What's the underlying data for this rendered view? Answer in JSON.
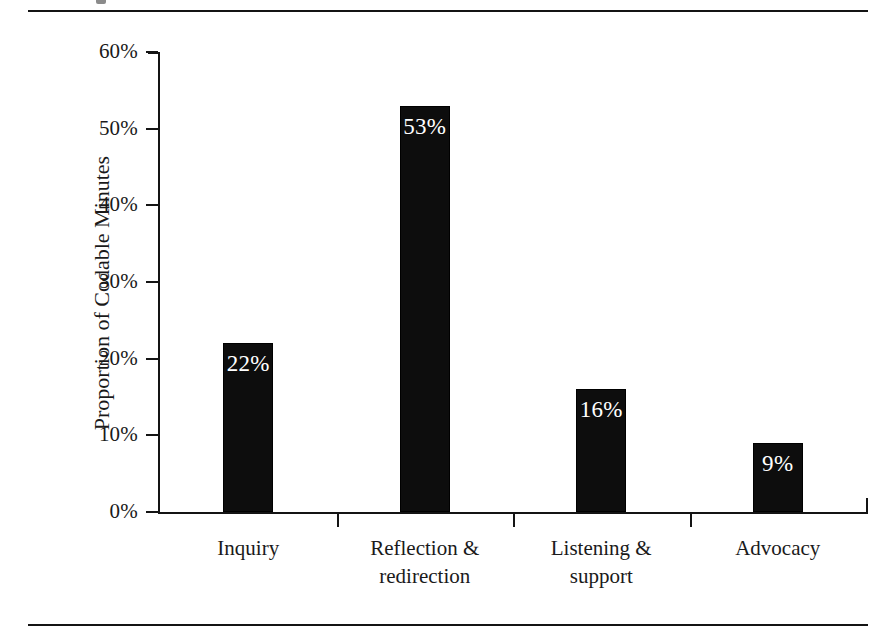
{
  "figure": {
    "rules": {
      "top_label": "top-rule",
      "bottom_label": "bottom-rule"
    }
  },
  "chart_data": {
    "type": "bar",
    "title": "",
    "xlabel": "",
    "ylabel": "Proportion of Codable Minutes",
    "categories": [
      "Inquiry",
      "Reflection &\nredirection",
      "Listening &\nsupport",
      "Advocacy"
    ],
    "values": [
      22,
      53,
      16,
      9
    ],
    "data_labels": [
      "22%",
      "53%",
      "16%",
      "9%"
    ],
    "ylim": [
      0,
      60
    ],
    "yticks": [
      0,
      10,
      20,
      30,
      40,
      50,
      60
    ],
    "ytick_labels": [
      "0%",
      "10%",
      "20%",
      "30%",
      "40%",
      "50%",
      "60%"
    ],
    "grid": false,
    "legend": null,
    "bar_color": "#0d0d0d",
    "data_label_color": "#ffffff",
    "axis_color": "#141414",
    "background_color": "#ffffff"
  }
}
